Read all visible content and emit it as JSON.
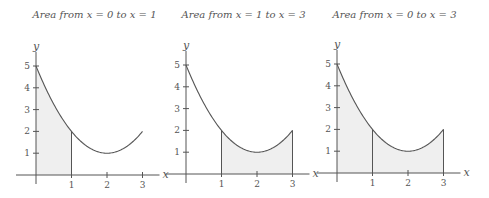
{
  "chart_data": [
    {
      "type": "area",
      "title": "Area from x = 0 to x = 1",
      "function": "f(x) = x^2 - 4x + 5",
      "xlabel": "x",
      "ylabel": "y",
      "x_ticks": [
        1,
        2,
        3
      ],
      "y_ticks": [
        1,
        2,
        3,
        4,
        5
      ],
      "xlim": [
        0,
        3
      ],
      "ylim": [
        0,
        5
      ],
      "grid": false,
      "curve": {
        "x": [
          0,
          0.5,
          1,
          1.5,
          2,
          2.5,
          3
        ],
        "y": [
          5,
          3.25,
          2,
          1.25,
          1,
          1.25,
          2
        ]
      },
      "shaded_interval": [
        0,
        1
      ]
    },
    {
      "type": "area",
      "title": "Area from x = 1 to x = 3",
      "function": "f(x) = x^2 - 4x + 5",
      "xlabel": "x",
      "ylabel": "y",
      "x_ticks": [
        1,
        2,
        3
      ],
      "y_ticks": [
        1,
        2,
        3,
        4,
        5
      ],
      "xlim": [
        0,
        3
      ],
      "ylim": [
        0,
        5
      ],
      "grid": false,
      "curve": {
        "x": [
          0,
          0.5,
          1,
          1.5,
          2,
          2.5,
          3
        ],
        "y": [
          5,
          3.25,
          2,
          1.25,
          1,
          1.25,
          2
        ]
      },
      "shaded_interval": [
        1,
        3
      ]
    },
    {
      "type": "area",
      "title": "Area from x = 0 to x = 3",
      "function": "f(x) = x^2 - 4x + 5",
      "xlabel": "x",
      "ylabel": "y",
      "x_ticks": [
        1,
        2,
        3
      ],
      "y_ticks": [
        1,
        2,
        3,
        4,
        5
      ],
      "xlim": [
        0,
        3
      ],
      "ylim": [
        0,
        5
      ],
      "grid": false,
      "curve": {
        "x": [
          0,
          0.5,
          1,
          1.5,
          2,
          2.5,
          3
        ],
        "y": [
          5,
          3.25,
          2,
          1.25,
          1,
          1.25,
          2
        ]
      },
      "shaded_interval": [
        0,
        3
      ],
      "divider_at": [
        1
      ]
    }
  ],
  "panels": [
    {
      "title": "Area from x = 0 to x = 1",
      "origin": [
        36,
        175
      ],
      "shade_from": 0,
      "shade_to": 1,
      "dividers": []
    },
    {
      "title": "Area from x = 1 to x = 3",
      "origin": [
        186,
        174
      ],
      "shade_from": 1,
      "shade_to": 3,
      "dividers": []
    },
    {
      "title": "Area from x = 0 to x = 3",
      "origin": [
        337,
        173
      ],
      "shade_from": 0,
      "shade_to": 3,
      "dividers": [
        1
      ]
    }
  ],
  "style": {
    "line_color": "#555555",
    "fill_color": "#efefef",
    "x_unit_px": 35.5,
    "y_unit_px": 21.8
  },
  "labels": {
    "x_axis": "x",
    "y_axis": "y",
    "x_ticks": [
      "1",
      "2",
      "3"
    ],
    "y_ticks": [
      "1",
      "2",
      "3",
      "4",
      "5"
    ]
  }
}
